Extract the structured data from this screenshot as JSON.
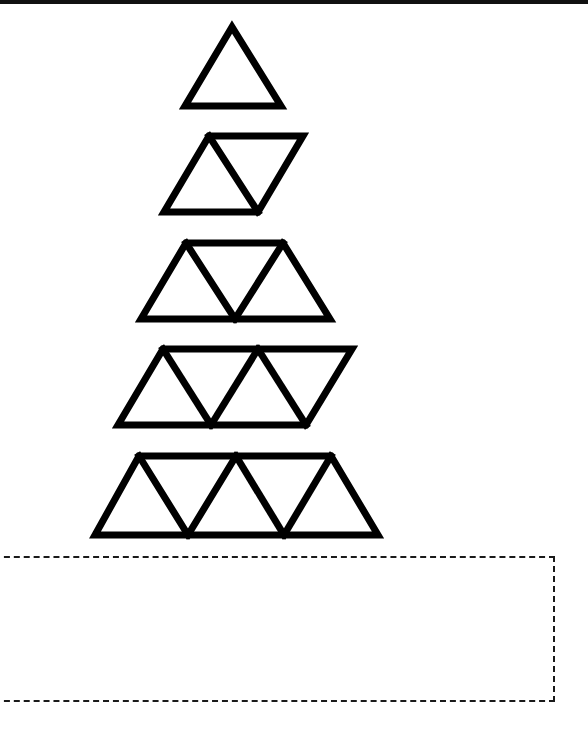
{
  "worksheet": {
    "top_rule_color": "#111111",
    "stroke_color": "#000000",
    "stroke_width": 7,
    "pattern": {
      "description": "growing pattern of triangles",
      "figures": [
        {
          "index": 1,
          "triangle_count": 1,
          "shape": "triangle",
          "points": [
            [
              232,
              27
            ],
            [
              185,
              106
            ],
            [
              281,
              106
            ]
          ],
          "inner_lines": []
        },
        {
          "index": 2,
          "triangle_count": 2,
          "shape": "parallelogram",
          "points": [
            [
              209,
              136
            ],
            [
              303,
              136
            ],
            [
              258,
              212
            ],
            [
              164,
              212
            ]
          ],
          "inner_lines": [
            [
              [
                209,
                136
              ],
              [
                258,
                212
              ]
            ]
          ]
        },
        {
          "index": 3,
          "triangle_count": 3,
          "shape": "trapezoid",
          "points": [
            [
              186,
              243
            ],
            [
              283,
              243
            ],
            [
              330,
              319
            ],
            [
              141,
              319
            ]
          ],
          "inner_lines": [
            [
              [
                186,
                243
              ],
              [
                235,
                319
              ]
            ],
            [
              [
                235,
                319
              ],
              [
                283,
                243
              ]
            ]
          ]
        },
        {
          "index": 4,
          "triangle_count": 4,
          "shape": "parallelogram",
          "points": [
            [
              163,
              349
            ],
            [
              352,
              349
            ],
            [
              306,
              425
            ],
            [
              118,
              425
            ]
          ],
          "inner_lines": [
            [
              [
                163,
                349
              ],
              [
                211,
                425
              ]
            ],
            [
              [
                211,
                425
              ],
              [
                258,
                349
              ]
            ],
            [
              [
                258,
                349
              ],
              [
                306,
                425
              ]
            ]
          ]
        },
        {
          "index": 5,
          "triangle_count": 5,
          "shape": "trapezoid",
          "points": [
            [
              139,
              456
            ],
            [
              331,
              456
            ],
            [
              378,
              535
            ],
            [
              95,
              535
            ]
          ],
          "inner_lines": [
            [
              [
                139,
                456
              ],
              [
                188,
                535
              ]
            ],
            [
              [
                188,
                535
              ],
              [
                236,
                456
              ]
            ],
            [
              [
                236,
                456
              ],
              [
                284,
                535
              ]
            ],
            [
              [
                284,
                535
              ],
              [
                331,
                456
              ]
            ]
          ]
        }
      ]
    },
    "answer_box": {
      "border_style": "dashed",
      "content": ""
    }
  }
}
